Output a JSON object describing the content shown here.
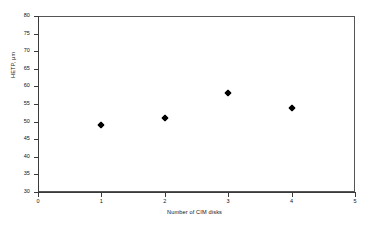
{
  "chart_data": {
    "type": "scatter",
    "title": "",
    "xlabel": "Number of CIM disks",
    "ylabel": "HETP, µm",
    "xlim": [
      0,
      5
    ],
    "ylim": [
      30,
      80
    ],
    "xticks": [
      "0",
      "1",
      "2",
      "3",
      "4",
      "5"
    ],
    "yticks": [
      "30",
      "35",
      "40",
      "45",
      "50",
      "55",
      "60",
      "65",
      "70",
      "75",
      "80"
    ],
    "grid": false,
    "legend": false,
    "marker_style": "filled-diamond",
    "marker_color": "#000000",
    "x": [
      1,
      2,
      3,
      4
    ],
    "values": [
      49,
      51,
      58,
      54
    ],
    "points": [
      {
        "x": 1,
        "y": 49
      },
      {
        "x": 2,
        "y": 51
      },
      {
        "x": 3,
        "y": 58
      },
      {
        "x": 4,
        "y": 54
      }
    ],
    "series": [
      {
        "name": "HETP",
        "x": [
          1,
          2,
          3,
          4
        ],
        "values": [
          49,
          51,
          58,
          54
        ]
      }
    ]
  }
}
